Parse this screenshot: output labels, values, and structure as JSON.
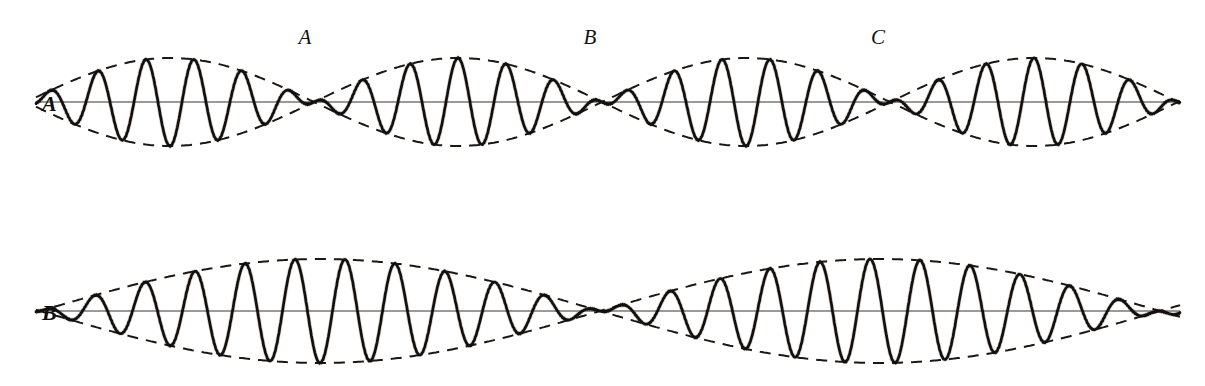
{
  "figure": {
    "background_color": "#ffffff",
    "ink_color": "#120f0d",
    "axis_color": "#3a3631",
    "width": 1205,
    "height": 386
  },
  "beat_markers": [
    {
      "label": "A",
      "x": 305,
      "y": 44
    },
    {
      "label": "B",
      "x": 590,
      "y": 44
    },
    {
      "label": "C",
      "x": 878,
      "y": 44
    }
  ],
  "traces": [
    {
      "id": "trace-a",
      "label": "A",
      "label_x": 52,
      "label_y": 111,
      "baseline_y": 102,
      "amplitude": 44,
      "carrier_wavelength": 48,
      "beat_period": 288,
      "node_positions": [
        170,
        458,
        745,
        1033
      ],
      "x_start": 36,
      "x_end": 1180,
      "description": "Carrier with short beat period; four nodes across the plate"
    },
    {
      "id": "trace-b",
      "label": "B",
      "label_x": 52,
      "label_y": 320,
      "baseline_y": 311,
      "amplitude": 52,
      "carrier_wavelength": 50,
      "beat_period": 560,
      "node_positions": [
        320,
        880
      ],
      "x_start": 36,
      "x_end": 1180,
      "description": "Carrier with long beat period; two nodes across the plate"
    }
  ],
  "chart_data": {
    "type": "line",
    "xlabel": "",
    "ylabel": "",
    "grid": false,
    "legend": "none",
    "annotations": [
      "A",
      "B",
      "C"
    ],
    "series": [
      {
        "name": "A",
        "form": "amplitude-modulated carrier",
        "carrier_wavelength_px": 48,
        "beat_period_px": 288,
        "amplitude_px": 44,
        "baseline_y_px": 102,
        "nodes_x_px": [
          170,
          458,
          745,
          1033
        ]
      },
      {
        "name": "B",
        "form": "amplitude-modulated carrier",
        "carrier_wavelength_px": 50,
        "beat_period_px": 560,
        "amplitude_px": 52,
        "baseline_y_px": 311,
        "nodes_x_px": [
          320,
          880
        ]
      }
    ]
  }
}
